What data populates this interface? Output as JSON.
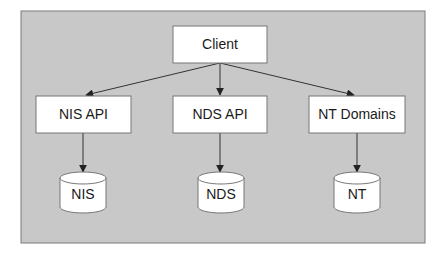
{
  "colors": {
    "panel_fill": "#c8c8c8",
    "panel_stroke": "#7a7a7a",
    "node_fill": "#ffffff",
    "node_stroke": "#777777",
    "edge": "#333333",
    "text": "#1a1a1a"
  },
  "diagram": {
    "client": {
      "label": "Client"
    },
    "apis": [
      {
        "label": "NIS API"
      },
      {
        "label": "NDS API"
      },
      {
        "label": "NT Domains"
      }
    ],
    "stores": [
      {
        "label": "NIS"
      },
      {
        "label": "NDS"
      },
      {
        "label": "NT"
      }
    ],
    "edges": [
      {
        "from": "Client",
        "to": "NIS API"
      },
      {
        "from": "Client",
        "to": "NDS API"
      },
      {
        "from": "Client",
        "to": "NT Domains"
      },
      {
        "from": "NIS API",
        "to": "NIS"
      },
      {
        "from": "NDS API",
        "to": "NDS"
      },
      {
        "from": "NT Domains",
        "to": "NT"
      }
    ]
  }
}
